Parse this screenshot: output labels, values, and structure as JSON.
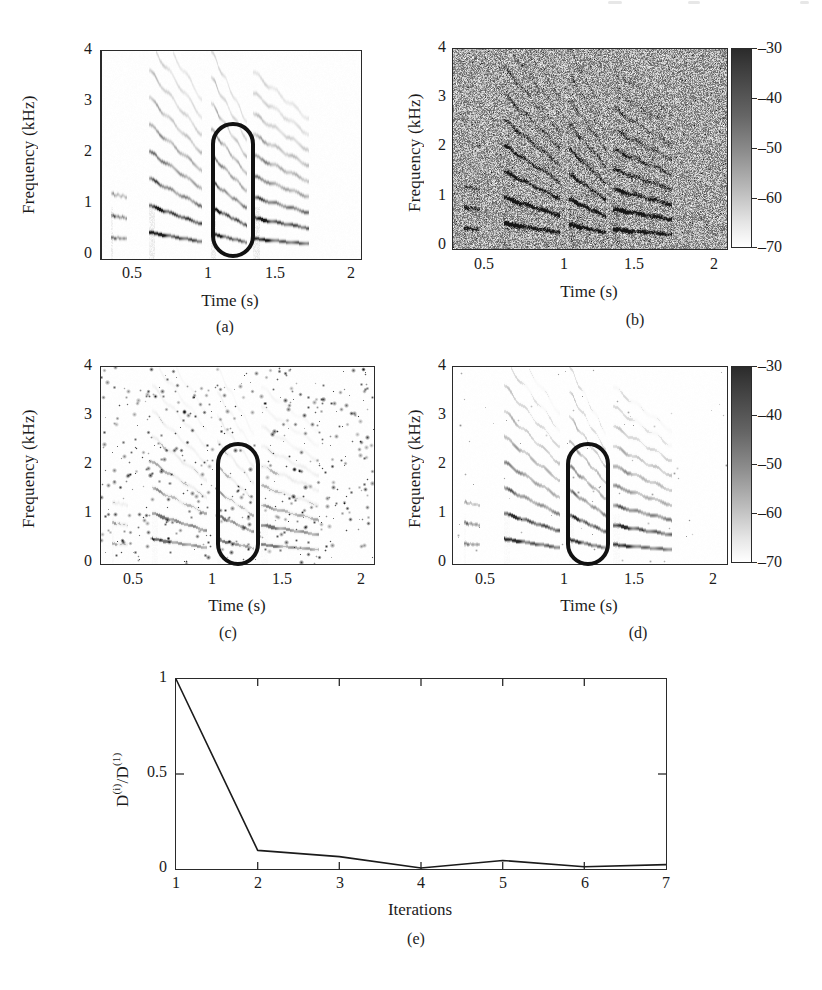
{
  "figure": {
    "kind": "multi-panel-scientific-figure",
    "panel_count": 5,
    "background": "#ffffff",
    "ink_color": "#1b1b1b"
  },
  "panels": {
    "a": {
      "letter": "(a)",
      "xlabel": "Time (s)",
      "ylabel": "Frequency (kHz)",
      "xticks": [
        "0.5",
        "1",
        "1.5",
        "2"
      ],
      "yticks": [
        "0",
        "1",
        "2",
        "3",
        "4"
      ],
      "xlim": [
        0.1,
        2.1
      ],
      "ylim": [
        0,
        4
      ],
      "has_colorbar": false,
      "annotation": "rounded-rectangle-highlight",
      "description": "clean speech spectrogram with harmonic striations"
    },
    "b": {
      "letter": "(b)",
      "xlabel": "Time (s)",
      "ylabel": "Frequency (kHz)",
      "xticks": [
        "0.5",
        "1",
        "1.5",
        "2"
      ],
      "yticks": [
        "0",
        "1",
        "2",
        "3",
        "4"
      ],
      "xlim": [
        0.1,
        2.1
      ],
      "ylim": [
        0,
        4
      ],
      "has_colorbar": true,
      "annotation": null,
      "description": "noisy spectrogram, speech buried in broadband noise"
    },
    "c": {
      "letter": "(c)",
      "xlabel": "Time (s)",
      "ylabel": "Frequency (kHz)",
      "xticks": [
        "0.5",
        "1",
        "1.5",
        "2"
      ],
      "yticks": [
        "0",
        "1",
        "2",
        "3",
        "4"
      ],
      "xlim": [
        0.1,
        2.1
      ],
      "ylim": [
        0,
        4
      ],
      "has_colorbar": false,
      "annotation": "rounded-rectangle-highlight",
      "description": "sparse residual-noise spectrogram with speckle artifacts"
    },
    "d": {
      "letter": "(d)",
      "xlabel": "Time (s)",
      "ylabel": "Frequency (kHz)",
      "xticks": [
        "0.5",
        "1",
        "1.5",
        "2"
      ],
      "yticks": [
        "0",
        "1",
        "2",
        "3",
        "4"
      ],
      "xlim": [
        0.1,
        2.1
      ],
      "ylim": [
        0,
        4
      ],
      "has_colorbar": true,
      "annotation": "rounded-rectangle-highlight",
      "description": "enhanced speech spectrogram, harmonics restored"
    },
    "e": {
      "letter": "(e)"
    }
  },
  "colorbar": {
    "ticks": [
      "–30",
      "–40",
      "–50",
      "–60",
      "–70"
    ],
    "tick_values": [
      -30,
      -40,
      -50,
      -60,
      -70
    ],
    "units": "dB",
    "top_color": "#2b2b2b",
    "bottom_color": "#ffffff",
    "colormap": "grayscale-inverted"
  },
  "chart_data": {
    "type": "line",
    "title": "",
    "xlabel": "Iterations",
    "ylabel": "D⁽ⁱ⁾/D⁽¹⁾",
    "ylabel_parts": {
      "base": "D",
      "sup_numerator": "(i)",
      "divider": "/",
      "base2": "D",
      "sup_denominator": "(1)"
    },
    "x": [
      1,
      2,
      3,
      4,
      5,
      6,
      7
    ],
    "categories": [
      "1",
      "2",
      "3",
      "4",
      "5",
      "6",
      "7"
    ],
    "values": [
      1.0,
      0.098,
      0.065,
      0.005,
      0.045,
      0.012,
      0.023
    ],
    "series": [
      {
        "name": "normalized divergence",
        "values": [
          1.0,
          0.098,
          0.065,
          0.005,
          0.045,
          0.012,
          0.023
        ]
      }
    ],
    "xticks": [
      "1",
      "2",
      "3",
      "4",
      "5",
      "6",
      "7"
    ],
    "yticks": [
      "0",
      "0.5",
      "1"
    ],
    "ytick_values": [
      0,
      0.5,
      1
    ],
    "xlim": [
      1,
      7
    ],
    "ylim": [
      0,
      1
    ],
    "grid": false,
    "legend": null,
    "line_color": "#1b1b1b"
  }
}
